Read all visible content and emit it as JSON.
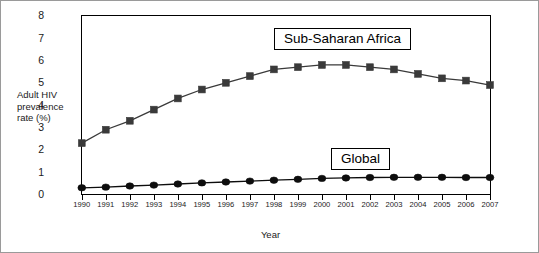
{
  "chart_data": {
    "type": "line",
    "title": "",
    "xlabel": "Year",
    "ylabel": "Adult HIV prevalence rate (%)",
    "ylabel_lines": [
      "Adult HIV",
      "prevalence",
      "rate (%)"
    ],
    "categories": [
      "1990",
      "1991",
      "1992",
      "1993",
      "1994",
      "1995",
      "1996",
      "1997",
      "1998",
      "1999",
      "2000",
      "2001",
      "2002",
      "2003",
      "2004",
      "2005",
      "2006",
      "2007"
    ],
    "x": [
      1990,
      1991,
      1992,
      1993,
      1994,
      1995,
      1996,
      1997,
      1998,
      1999,
      2000,
      2001,
      2002,
      2003,
      2004,
      2005,
      2006,
      2007
    ],
    "xlim": [
      1990,
      2007
    ],
    "ylim": [
      0,
      8
    ],
    "yticks": [
      "0",
      "1",
      "2",
      "3",
      "4",
      "5",
      "6",
      "7",
      "8"
    ],
    "ytick_values": [
      0,
      1,
      2,
      3,
      4,
      5,
      6,
      7,
      8
    ],
    "grid": false,
    "legend_position": "inline-annotations",
    "series": [
      {
        "name": "Sub-Saharan Africa",
        "marker": "square",
        "color": "#3a3a3a",
        "values": [
          2.3,
          2.9,
          3.3,
          3.8,
          4.3,
          4.7,
          5.0,
          5.3,
          5.6,
          5.7,
          5.8,
          5.8,
          5.7,
          5.6,
          5.4,
          5.2,
          5.1,
          4.9
        ]
      },
      {
        "name": "Global",
        "marker": "circle",
        "color": "#0d0d0d",
        "values": [
          0.3,
          0.33,
          0.38,
          0.42,
          0.47,
          0.52,
          0.56,
          0.6,
          0.64,
          0.68,
          0.72,
          0.74,
          0.76,
          0.77,
          0.77,
          0.77,
          0.76,
          0.76
        ]
      }
    ],
    "annotations": [
      {
        "text": "Sub-Saharan Africa",
        "x_px": 273,
        "y_px": 27
      },
      {
        "text": "Global",
        "x_px": 330,
        "y_px": 147
      }
    ]
  },
  "axis": {
    "x_title": "Year",
    "y_title_line1": "Adult HIV",
    "y_title_line2": "prevalence",
    "y_title_line3": "rate (%)"
  },
  "colors": {
    "frame": "#000000",
    "series_sub_saharan": "#3a3a3a",
    "series_global": "#0d0d0d",
    "page_border": "#9a9a9a",
    "background": "#ffffff"
  }
}
